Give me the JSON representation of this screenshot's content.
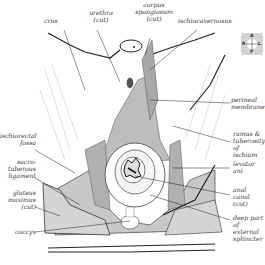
{
  "diagram": {
    "labels_top": [
      {
        "id": "crus",
        "text": "crus"
      },
      {
        "id": "urethra",
        "text": "urethra\n(cut)"
      },
      {
        "id": "corpus",
        "text": "corpus\nspongiosum\n(cut)"
      },
      {
        "id": "ischiocavernosus",
        "text": "ischiocavernosus"
      }
    ],
    "labels_right": [
      {
        "id": "perineal-membrane",
        "text": "perineal\nmembrane"
      },
      {
        "id": "ramus",
        "text": "ramus &\ntuberosity\nof ischium"
      },
      {
        "id": "levator",
        "text": "levator\nani"
      },
      {
        "id": "anal-canal",
        "text": "anal\ncanal\n(cut)"
      },
      {
        "id": "external-sphincter",
        "text": "deep part\nof external\nsphincter"
      }
    ],
    "labels_left": [
      {
        "id": "ischiorectal",
        "text": "ischiorectal\nfossa"
      },
      {
        "id": "sacrotuberous",
        "text": "sacro-\ntuberous\nligament"
      },
      {
        "id": "gluteus",
        "text": "gluteus\nmaximus\n(cut)"
      },
      {
        "id": "coccyx",
        "text": "coccyx"
      }
    ],
    "orientation": {
      "top": "A",
      "bottom": "P",
      "left": "R",
      "right": "L"
    },
    "colors": {
      "fill_light": "#e8e8e8",
      "fill_mid": "#c8c8c8",
      "fill_dark": "#a8a8a8",
      "line": "#222222"
    }
  }
}
